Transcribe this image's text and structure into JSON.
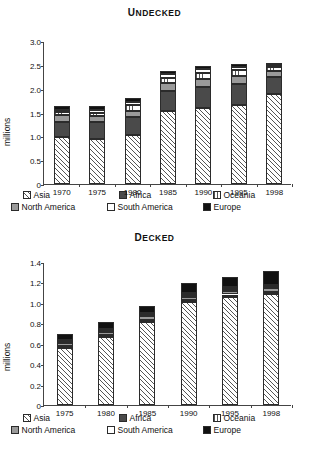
{
  "chart_data": [
    {
      "type": "bar",
      "subtype": "stacked",
      "title": "Undecked",
      "xlabel": "",
      "ylabel": "millions",
      "ylim": [
        0,
        3.0
      ],
      "yticks": [
        "0",
        "0.5",
        "1.0",
        "1.5",
        "2.0",
        "2.5",
        "3.0"
      ],
      "ytick_values": [
        0,
        0.5,
        1.0,
        1.5,
        2.0,
        2.5,
        3.0
      ],
      "grid": false,
      "legend_position": "bottom",
      "categories": [
        "1970",
        "1975",
        "1980",
        "1985",
        "1990",
        "1995",
        "1998"
      ],
      "series": [
        {
          "name": "Asia",
          "values": [
            0.99,
            0.94,
            1.02,
            1.53,
            1.6,
            1.66,
            1.88
          ]
        },
        {
          "name": "Africa",
          "values": [
            0.32,
            0.36,
            0.38,
            0.42,
            0.43,
            0.43,
            0.36
          ]
        },
        {
          "name": "North America",
          "values": [
            0.14,
            0.13,
            0.14,
            0.16,
            0.17,
            0.17,
            0.13
          ]
        },
        {
          "name": "Oceania",
          "values": [
            0.06,
            0.07,
            0.11,
            0.12,
            0.13,
            0.13,
            0.08
          ]
        },
        {
          "name": "South America",
          "values": [
            0.05,
            0.06,
            0.07,
            0.07,
            0.08,
            0.07,
            0.04
          ]
        },
        {
          "name": "Europe",
          "values": [
            0.08,
            0.08,
            0.08,
            0.07,
            0.07,
            0.06,
            0.04
          ]
        }
      ],
      "totals": [
        1.64,
        1.64,
        1.8,
        2.37,
        2.48,
        2.52,
        2.53
      ]
    },
    {
      "type": "bar",
      "subtype": "stacked",
      "title": "Decked",
      "xlabel": "",
      "ylabel": "millions",
      "ylim": [
        0,
        1.4
      ],
      "yticks": [
        "0",
        "0.2",
        "0.4",
        "0.6",
        "0.8",
        "1.0",
        "1.2",
        "1.4"
      ],
      "ytick_values": [
        0,
        0.2,
        0.4,
        0.6,
        0.8,
        1.0,
        1.2,
        1.4
      ],
      "grid": false,
      "legend_position": "bottom",
      "categories": [
        "1975",
        "1980",
        "1985",
        "1990",
        "1995",
        "1998"
      ],
      "series": [
        {
          "name": "Asia",
          "values": [
            0.555,
            0.665,
            0.815,
            1.01,
            1.06,
            1.085
          ]
        },
        {
          "name": "Africa",
          "values": [
            0.02,
            0.02,
            0.022,
            0.022,
            0.022,
            0.022
          ]
        },
        {
          "name": "North America",
          "values": [
            0.03,
            0.03,
            0.03,
            0.03,
            0.035,
            0.035
          ]
        },
        {
          "name": "Oceania",
          "values": [
            0.02,
            0.018,
            0.018,
            0.018,
            0.02,
            0.02
          ]
        },
        {
          "name": "South America",
          "values": [
            0.01,
            0.012,
            0.013,
            0.014,
            0.015,
            0.016
          ]
        },
        {
          "name": "Europe",
          "values": [
            0.065,
            0.065,
            0.072,
            0.096,
            0.098,
            0.132
          ]
        }
      ],
      "totals": [
        0.7,
        0.81,
        0.97,
        1.19,
        1.25,
        1.31
      ]
    }
  ],
  "legend": {
    "rows": [
      [
        {
          "label": "Asia",
          "swatch": "diagonal-hatch"
        },
        {
          "label": "Africa",
          "swatch": "dark-gray"
        },
        {
          "label": "Oceania",
          "swatch": "vertical-hatch"
        }
      ],
      [
        {
          "label": "North America",
          "swatch": "mid-gray"
        },
        {
          "label": "South America",
          "swatch": "white"
        },
        {
          "label": "Europe",
          "swatch": "black"
        }
      ]
    ]
  },
  "colors": {
    "africa": "#4a4a4a",
    "north_america": "#9a9a9a",
    "europe": "#111111",
    "south_america": "#ffffff",
    "axis": "#444444"
  }
}
